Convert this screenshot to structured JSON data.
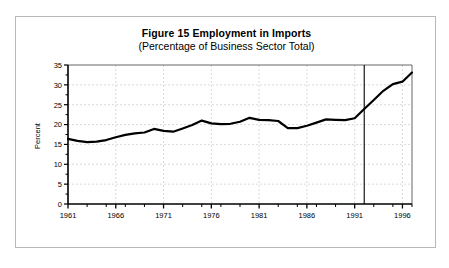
{
  "figure": {
    "title": "Figure 15 Employment in Imports",
    "subtitle": "(Percentage of Business Sector Total)"
  },
  "chart_data": {
    "type": "line",
    "title": "Figure 15 Employment in Imports",
    "subtitle": "(Percentage of Business Sector Total)",
    "xlabel": "",
    "ylabel": "Percent",
    "xlim": [
      1961,
      1997
    ],
    "ylim": [
      0,
      35
    ],
    "yticks": [
      0,
      5,
      10,
      15,
      20,
      25,
      30,
      35
    ],
    "ytick_labels": [
      "0",
      "5",
      "10",
      "15",
      "20",
      "25",
      "30",
      "35"
    ],
    "xticks": [
      1961,
      1966,
      1971,
      1976,
      1981,
      1986,
      1991,
      1996
    ],
    "xtick_labels": [
      "1961",
      "1966",
      "1971",
      "1976",
      "1981",
      "1986",
      "1991",
      "1996"
    ],
    "x_minor_tick_interval": 1,
    "grid": true,
    "grid_style": "dashed",
    "grid_color": "#c8c8c8",
    "legend": null,
    "line_color": "#000000",
    "line_width": 2.2,
    "annotations": [
      {
        "type": "vertical-line",
        "x": 1992,
        "style": "solid",
        "color": "#000000",
        "label": ""
      }
    ],
    "x": [
      1961,
      1962,
      1963,
      1964,
      1965,
      1966,
      1967,
      1968,
      1969,
      1970,
      1971,
      1972,
      1973,
      1974,
      1975,
      1976,
      1977,
      1978,
      1979,
      1980,
      1981,
      1982,
      1983,
      1984,
      1985,
      1986,
      1987,
      1988,
      1989,
      1990,
      1991,
      1992,
      1993,
      1994,
      1995,
      1996,
      1997
    ],
    "series": [
      {
        "name": "Employment in Imports",
        "values": [
          16.4,
          15.9,
          15.6,
          15.7,
          16.1,
          16.8,
          17.4,
          17.8,
          18.0,
          18.9,
          18.4,
          18.2,
          19.0,
          19.9,
          21.0,
          20.3,
          20.1,
          20.2,
          20.7,
          21.7,
          21.2,
          21.1,
          20.9,
          19.1,
          19.1,
          19.7,
          20.5,
          21.3,
          21.2,
          21.1,
          21.6,
          23.9,
          26.2,
          28.5,
          30.2,
          30.8,
          33.1
        ]
      }
    ]
  }
}
